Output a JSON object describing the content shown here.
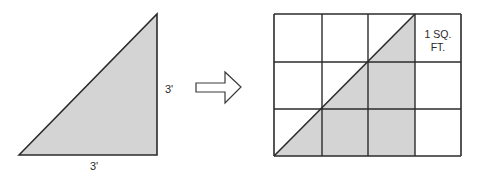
{
  "left_figure": {
    "side_label_vertical": "3'",
    "side_label_horizontal": "3'"
  },
  "right_figure": {
    "grid_rows": 3,
    "grid_cols": 4,
    "cell_label_line1": "1 SQ.",
    "cell_label_line2": "FT."
  },
  "colors": {
    "fill": "#d4d4d4",
    "stroke": "#2b2b2b",
    "background": "#ffffff"
  }
}
